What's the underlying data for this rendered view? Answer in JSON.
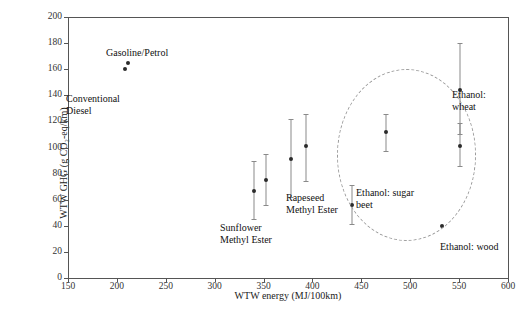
{
  "chart_data": {
    "type": "scatter",
    "title": "",
    "xlabel": "WTW energy (MJ/100km)",
    "ylabel": "WTW GHG (g CO₂-eq/km)",
    "xlim": [
      150,
      600
    ],
    "ylim": [
      0,
      200
    ],
    "xticks": [
      150,
      200,
      250,
      300,
      350,
      400,
      450,
      500,
      550,
      600
    ],
    "yticks": [
      0,
      20,
      40,
      60,
      80,
      100,
      120,
      140,
      160,
      180,
      200
    ],
    "grid": false,
    "legend": "none",
    "points": [
      {
        "label": "Conventional Diesel",
        "x": 208,
        "y": 160,
        "yerr_low": 160,
        "yerr_high": 160
      },
      {
        "label": "Gasoline/Petrol",
        "x": 211,
        "y": 165,
        "yerr_low": 165,
        "yerr_high": 165
      },
      {
        "label": "Sunflower Methyl Ester",
        "x": 340,
        "y": 67,
        "yerr_low": 45,
        "yerr_high": 90
      },
      {
        "label": "Sunflower Methyl Ester",
        "x": 352,
        "y": 75,
        "yerr_low": 56,
        "yerr_high": 95
      },
      {
        "label": "Rapeseed Methyl Ester",
        "x": 378,
        "y": 91,
        "yerr_low": 62,
        "yerr_high": 122
      },
      {
        "label": "Rapeseed Methyl Ester",
        "x": 393,
        "y": 101,
        "yerr_low": 74,
        "yerr_high": 126
      },
      {
        "label": "Ethanol: sugar beet",
        "x": 440,
        "y": 56,
        "yerr_low": 41,
        "yerr_high": 71
      },
      {
        "label": "Ethanol: sugar beet",
        "x": 475,
        "y": 112,
        "yerr_low": 97,
        "yerr_high": 126
      },
      {
        "label": "Ethanol: sugar beet",
        "x": 551,
        "y": 101,
        "yerr_low": 86,
        "yerr_high": 119
      },
      {
        "label": "Ethanol: wheat",
        "x": 551,
        "y": 144,
        "yerr_low": 110,
        "yerr_high": 180
      },
      {
        "label": "Ethanol: wood",
        "x": 533,
        "y": 40,
        "yerr_low": 40,
        "yerr_high": 40
      }
    ],
    "annotations": [
      {
        "name": "conventional-diesel",
        "text": "Conventional\nDiesel"
      },
      {
        "name": "gasoline-petrol",
        "text": "Gasoline/Petrol"
      },
      {
        "name": "sunflower-methyl-ester",
        "text": "Sunflower\nMethyl Ester"
      },
      {
        "name": "rapeseed-methyl-ester",
        "text": "Rapeseed\nMethyl Ester"
      },
      {
        "name": "ethanol-sugar-beet",
        "text": "Ethanol: sugar\nbeet"
      },
      {
        "name": "ethanol-wheat",
        "text": "Ethanol:\nwheat"
      },
      {
        "name": "ethanol-wood",
        "text": "Ethanol: wood"
      }
    ],
    "shapes": [
      {
        "name": "ethanol-cluster-ellipse",
        "type": "dashed-ellipse"
      }
    ],
    "colors": {
      "marker": "#2b2b2b",
      "errorbar": "#8a8a8a",
      "axis": "#555555",
      "ellipse": "#9a9a9a",
      "background": "#ffffff"
    }
  }
}
